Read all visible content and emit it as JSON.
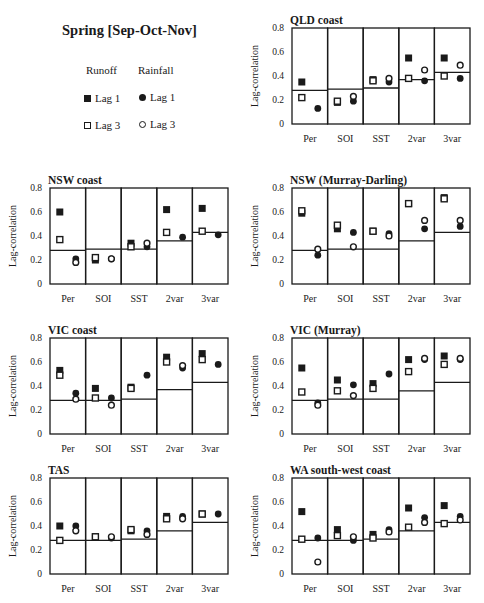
{
  "figure": {
    "title": "Spring [Sep-Oct-Nov]",
    "legend": {
      "col_headers": [
        "Runoff",
        "Rainfall"
      ],
      "items": [
        {
          "label": "Lag 1",
          "variable": "Runoff",
          "marker": "filled-square"
        },
        {
          "label": "Lag 3",
          "variable": "Runoff",
          "marker": "open-square"
        },
        {
          "label": "Lag 1",
          "variable": "Rainfall",
          "marker": "filled-circle"
        },
        {
          "label": "Lag 3",
          "variable": "Rainfall",
          "marker": "open-circle"
        }
      ]
    },
    "colors": {
      "ink": "#1a1a1a",
      "background": "#ffffff"
    }
  },
  "chart_data": [
    {
      "type": "scatter",
      "title": "QLD coast",
      "xlabel": "",
      "ylabel": "Lag-correlation",
      "ylim": [
        0,
        0.8
      ],
      "yticks": [
        "0",
        "0.2",
        "0.4",
        "0.6",
        "0.8"
      ],
      "categories": [
        "Per",
        "SOI",
        "SST",
        "2var",
        "3var"
      ],
      "significance_line": [
        0.28,
        0.29,
        0.3,
        0.37,
        0.43
      ],
      "series": [
        {
          "name": "Runoff Lag 1",
          "values": [
            0.35,
            0.18,
            0.37,
            0.55,
            0.55
          ]
        },
        {
          "name": "Runoff Lag 3",
          "values": [
            0.22,
            0.19,
            0.36,
            0.38,
            0.4
          ]
        },
        {
          "name": "Rainfall Lag 1",
          "values": [
            0.13,
            0.19,
            0.35,
            0.36,
            0.38
          ]
        },
        {
          "name": "Rainfall Lag 3",
          "values": [
            null,
            0.23,
            0.38,
            0.45,
            0.49
          ]
        }
      ]
    },
    {
      "type": "scatter",
      "title": "NSW coast",
      "xlabel": "",
      "ylabel": "Lag-correlation",
      "ylim": [
        0,
        0.8
      ],
      "yticks": [
        "0",
        "0.2",
        "0.4",
        "0.6",
        "0.8"
      ],
      "categories": [
        "Per",
        "SOI",
        "SST",
        "2var",
        "3var"
      ],
      "significance_line": [
        0.28,
        0.29,
        0.29,
        0.36,
        0.43
      ],
      "series": [
        {
          "name": "Runoff Lag 1",
          "values": [
            0.6,
            0.2,
            0.34,
            0.62,
            0.63
          ]
        },
        {
          "name": "Runoff Lag 3",
          "values": [
            0.37,
            0.22,
            0.31,
            0.43,
            0.44
          ]
        },
        {
          "name": "Rainfall Lag 1",
          "values": [
            0.21,
            0.21,
            0.31,
            0.39,
            0.41
          ]
        },
        {
          "name": "Rainfall Lag 3",
          "values": [
            0.18,
            0.21,
            0.34,
            null,
            null
          ]
        }
      ]
    },
    {
      "type": "scatter",
      "title": "NSW (Murray-Darling)",
      "xlabel": "",
      "ylabel": "Lag-correlation",
      "ylim": [
        0,
        0.8
      ],
      "yticks": [
        "0",
        "0.2",
        "0.4",
        "0.6",
        "0.8"
      ],
      "categories": [
        "Per",
        "SOI",
        "SST",
        "2var",
        "3var"
      ],
      "significance_line": [
        0.28,
        0.29,
        0.29,
        0.36,
        0.43
      ],
      "series": [
        {
          "name": "Runoff Lag 1",
          "values": [
            0.59,
            0.46,
            0.44,
            0.67,
            0.72
          ]
        },
        {
          "name": "Runoff Lag 3",
          "values": [
            0.61,
            0.49,
            0.44,
            0.67,
            0.71
          ]
        },
        {
          "name": "Rainfall Lag 1",
          "values": [
            0.24,
            0.43,
            0.42,
            0.46,
            0.48
          ]
        },
        {
          "name": "Rainfall Lag 3",
          "values": [
            0.29,
            0.31,
            0.4,
            0.53,
            0.53
          ]
        }
      ]
    },
    {
      "type": "scatter",
      "title": "VIC coast",
      "xlabel": "",
      "ylabel": "Lag-correlation",
      "ylim": [
        0,
        0.8
      ],
      "yticks": [
        "0",
        "0.2",
        "0.4",
        "0.6",
        "0.8"
      ],
      "categories": [
        "Per",
        "SOI",
        "SST",
        "2var",
        "3var"
      ],
      "significance_line": [
        0.28,
        0.28,
        0.29,
        0.37,
        0.43
      ],
      "series": [
        {
          "name": "Runoff Lag 1",
          "values": [
            0.53,
            0.38,
            0.39,
            0.64,
            0.67
          ]
        },
        {
          "name": "Runoff Lag 3",
          "values": [
            0.49,
            0.3,
            0.38,
            0.6,
            0.62
          ]
        },
        {
          "name": "Rainfall Lag 1",
          "values": [
            0.34,
            0.3,
            0.49,
            0.55,
            0.58
          ]
        },
        {
          "name": "Rainfall Lag 3",
          "values": [
            0.29,
            0.24,
            null,
            0.57,
            null
          ]
        }
      ]
    },
    {
      "type": "scatter",
      "title": "VIC (Murray)",
      "xlabel": "",
      "ylabel": "Lag-correlation",
      "ylim": [
        0,
        0.8
      ],
      "yticks": [
        "0",
        "0.2",
        "0.4",
        "0.6",
        "0.8"
      ],
      "categories": [
        "Per",
        "SOI",
        "SST",
        "2var",
        "3var"
      ],
      "significance_line": [
        0.28,
        0.29,
        0.29,
        0.36,
        0.43
      ],
      "series": [
        {
          "name": "Runoff Lag 1",
          "values": [
            0.55,
            0.45,
            0.42,
            0.62,
            0.65
          ]
        },
        {
          "name": "Runoff Lag 3",
          "values": [
            0.35,
            0.36,
            0.38,
            0.52,
            0.58
          ]
        },
        {
          "name": "Rainfall Lag 1",
          "values": [
            0.26,
            0.41,
            0.5,
            0.62,
            0.62
          ]
        },
        {
          "name": "Rainfall Lag 3",
          "values": [
            0.24,
            0.32,
            null,
            0.63,
            0.63
          ]
        }
      ]
    },
    {
      "type": "scatter",
      "title": "TAS",
      "xlabel": "",
      "ylabel": "Lag-correlation",
      "ylim": [
        0,
        0.8
      ],
      "yticks": [
        "0",
        "0.2",
        "0.4",
        "0.6",
        "0.8"
      ],
      "categories": [
        "Per",
        "SOI",
        "SST",
        "2var",
        "3var"
      ],
      "significance_line": [
        0.28,
        0.28,
        0.29,
        0.36,
        0.43
      ],
      "series": [
        {
          "name": "Runoff Lag 1",
          "values": [
            0.4,
            0.31,
            0.36,
            0.48,
            0.5
          ]
        },
        {
          "name": "Runoff Lag 3",
          "values": [
            0.28,
            0.31,
            0.37,
            0.46,
            0.5
          ]
        },
        {
          "name": "Rainfall Lag 1",
          "values": [
            0.4,
            0.3,
            0.36,
            0.48,
            0.5
          ]
        },
        {
          "name": "Rainfall Lag 3",
          "values": [
            0.36,
            0.31,
            0.33,
            0.46,
            null
          ]
        }
      ]
    },
    {
      "type": "scatter",
      "title": "WA south-west coast",
      "xlabel": "",
      "ylabel": "Lag-correlation",
      "ylim": [
        0,
        0.8
      ],
      "yticks": [
        "0",
        "0.2",
        "0.4",
        "0.6",
        "0.8"
      ],
      "categories": [
        "Per",
        "SOI",
        "SST",
        "2var",
        "3var"
      ],
      "significance_line": [
        0.28,
        0.28,
        0.29,
        0.36,
        0.43
      ],
      "series": [
        {
          "name": "Runoff Lag 1",
          "values": [
            0.52,
            0.37,
            0.33,
            0.55,
            0.57
          ]
        },
        {
          "name": "Runoff Lag 3",
          "values": [
            0.29,
            0.32,
            0.3,
            0.39,
            0.42
          ]
        },
        {
          "name": "Rainfall Lag 1",
          "values": [
            0.3,
            0.28,
            0.37,
            0.47,
            0.48
          ]
        },
        {
          "name": "Rainfall Lag 3",
          "values": [
            0.1,
            0.31,
            0.35,
            0.43,
            0.45
          ]
        }
      ]
    }
  ],
  "layout_slots": [
    {
      "panel": 0,
      "left": 242,
      "top": 0
    },
    {
      "panel": 1,
      "left": 0,
      "top": 160
    },
    {
      "panel": 2,
      "left": 242,
      "top": 160
    },
    {
      "panel": 3,
      "left": 0,
      "top": 310
    },
    {
      "panel": 4,
      "left": 242,
      "top": 310
    },
    {
      "panel": 5,
      "left": 0,
      "top": 450
    },
    {
      "panel": 6,
      "left": 242,
      "top": 450
    }
  ]
}
